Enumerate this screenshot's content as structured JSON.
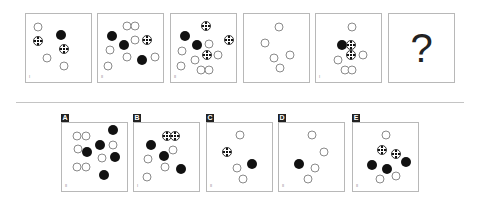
{
  "question": {
    "panels": [
      {
        "id": "1",
        "corner": "I",
        "circles": [
          {
            "t": "white",
            "x": 19,
            "y": 19
          },
          {
            "t": "ball",
            "x": 18,
            "y": 39
          },
          {
            "t": "black",
            "x": 54,
            "y": 31
          },
          {
            "t": "ball",
            "x": 58,
            "y": 52
          },
          {
            "t": "white",
            "x": 33,
            "y": 64
          },
          {
            "t": "white",
            "x": 58,
            "y": 76
          }
        ]
      },
      {
        "id": "2",
        "corner": "II",
        "circles": [
          {
            "t": "white",
            "x": 45,
            "y": 17
          },
          {
            "t": "white",
            "x": 57,
            "y": 17
          },
          {
            "t": "black",
            "x": 22,
            "y": 33
          },
          {
            "t": "white",
            "x": 57,
            "y": 38
          },
          {
            "t": "ball",
            "x": 76,
            "y": 38
          },
          {
            "t": "black",
            "x": 40,
            "y": 45
          },
          {
            "t": "white",
            "x": 18,
            "y": 53
          },
          {
            "t": "white",
            "x": 45,
            "y": 63
          },
          {
            "t": "black",
            "x": 68,
            "y": 67
          },
          {
            "t": "white",
            "x": 87,
            "y": 63
          },
          {
            "t": "white",
            "x": 16,
            "y": 76
          }
        ]
      },
      {
        "id": "3",
        "corner": "II",
        "circles": [
          {
            "t": "ball",
            "x": 54,
            "y": 17
          },
          {
            "t": "black",
            "x": 22,
            "y": 33
          },
          {
            "t": "ball",
            "x": 89,
            "y": 38
          },
          {
            "t": "black",
            "x": 40,
            "y": 45
          },
          {
            "t": "white",
            "x": 59,
            "y": 44
          },
          {
            "t": "white",
            "x": 17,
            "y": 54
          },
          {
            "t": "ball",
            "x": 55,
            "y": 61
          },
          {
            "t": "white",
            "x": 73,
            "y": 61
          },
          {
            "t": "white",
            "x": 37,
            "y": 67
          },
          {
            "t": "white",
            "x": 15,
            "y": 77
          },
          {
            "t": "white",
            "x": 46,
            "y": 83
          },
          {
            "t": "white",
            "x": 58,
            "y": 83
          }
        ]
      },
      {
        "id": "4",
        "corner": "",
        "circles": [
          {
            "t": "white",
            "x": 54,
            "y": 19
          },
          {
            "t": "white",
            "x": 33,
            "y": 43
          },
          {
            "t": "white",
            "x": 46,
            "y": 65
          },
          {
            "t": "white",
            "x": 70,
            "y": 61
          },
          {
            "t": "white",
            "x": 55,
            "y": 80
          }
        ]
      },
      {
        "id": "5",
        "corner": "I",
        "circles": [
          {
            "t": "white",
            "x": 55,
            "y": 19
          },
          {
            "t": "black",
            "x": 40,
            "y": 45
          },
          {
            "t": "ball",
            "x": 54,
            "y": 45
          },
          {
            "t": "ball",
            "x": 54,
            "y": 61
          },
          {
            "t": "white",
            "x": 34,
            "y": 67
          },
          {
            "t": "white",
            "x": 73,
            "y": 61
          },
          {
            "t": "white",
            "x": 44,
            "y": 83
          },
          {
            "t": "white",
            "x": 55,
            "y": 83
          }
        ]
      },
      {
        "id": "6",
        "corner": "",
        "question_mark": "?"
      }
    ]
  },
  "answers": {
    "options": [
      {
        "label": "A",
        "corner": "II",
        "circles": [
          {
            "t": "white",
            "x": 23,
            "y": 19
          },
          {
            "t": "white",
            "x": 37,
            "y": 19
          },
          {
            "t": "black",
            "x": 78,
            "y": 11
          },
          {
            "t": "white",
            "x": 25,
            "y": 38
          },
          {
            "t": "black",
            "x": 39,
            "y": 43
          },
          {
            "t": "black",
            "x": 59,
            "y": 32
          },
          {
            "t": "white",
            "x": 78,
            "y": 33
          },
          {
            "t": "white",
            "x": 62,
            "y": 52
          },
          {
            "t": "black",
            "x": 82,
            "y": 50
          },
          {
            "t": "white",
            "x": 23,
            "y": 64
          },
          {
            "t": "white",
            "x": 37,
            "y": 64
          },
          {
            "t": "black",
            "x": 65,
            "y": 77
          }
        ]
      },
      {
        "label": "B",
        "corner": "I",
        "circles": [
          {
            "t": "ball",
            "x": 51,
            "y": 19
          },
          {
            "t": "ball",
            "x": 63,
            "y": 19
          },
          {
            "t": "black",
            "x": 26,
            "y": 33
          },
          {
            "t": "white",
            "x": 60,
            "y": 40
          },
          {
            "t": "black",
            "x": 46,
            "y": 49
          },
          {
            "t": "white",
            "x": 22,
            "y": 53
          },
          {
            "t": "white",
            "x": 48,
            "y": 64
          },
          {
            "t": "black",
            "x": 72,
            "y": 68
          },
          {
            "t": "white",
            "x": 20,
            "y": 79
          }
        ]
      },
      {
        "label": "C",
        "corner": "II",
        "circles": [
          {
            "t": "white",
            "x": 50,
            "y": 17
          },
          {
            "t": "ball",
            "x": 30,
            "y": 43
          },
          {
            "t": "white",
            "x": 46,
            "y": 66
          },
          {
            "t": "black",
            "x": 69,
            "y": 61
          },
          {
            "t": "white",
            "x": 55,
            "y": 83
          }
        ]
      },
      {
        "label": "D",
        "corner": "II",
        "circles": [
          {
            "t": "white",
            "x": 50,
            "y": 17
          },
          {
            "t": "white",
            "x": 69,
            "y": 42
          },
          {
            "t": "black",
            "x": 31,
            "y": 61
          },
          {
            "t": "white",
            "x": 55,
            "y": 66
          },
          {
            "t": "white",
            "x": 44,
            "y": 83
          }
        ]
      },
      {
        "label": "E",
        "corner": "II",
        "circles": [
          {
            "t": "white",
            "x": 50,
            "y": 17
          },
          {
            "t": "ball",
            "x": 44,
            "y": 40
          },
          {
            "t": "ball",
            "x": 66,
            "y": 45
          },
          {
            "t": "black",
            "x": 29,
            "y": 62
          },
          {
            "t": "black",
            "x": 52,
            "y": 67
          },
          {
            "t": "black",
            "x": 81,
            "y": 57
          },
          {
            "t": "white",
            "x": 41,
            "y": 83
          },
          {
            "t": "white",
            "x": 66,
            "y": 78
          }
        ]
      }
    ]
  },
  "colors": {
    "panel_border": "#b8b8b8",
    "black_circle": "#111111",
    "white_circle_border": "#8a8a8a",
    "tab_background": "#222222",
    "divider": "#c4c4c4"
  }
}
